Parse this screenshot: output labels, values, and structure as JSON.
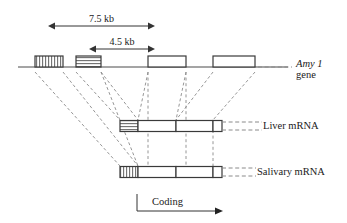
{
  "figure": {
    "gene_label_line1": "Amy 1",
    "gene_label_line2": "gene",
    "liver_label": "Liver mRNA",
    "salivary_label": "Salivary mRNA",
    "coding_label": "Coding"
  },
  "dimensions": [
    {
      "label": "7.5 kb",
      "x_start": 55,
      "x_end": 148,
      "y": 20
    },
    {
      "label": "4.5 kb",
      "x_start": 96,
      "x_end": 148,
      "y": 43
    }
  ],
  "colors": {
    "line": "#4a4a4a",
    "box_stroke": "#3a3a3a",
    "hatch": "#6e6e6e",
    "dashed": "#8a8a8a",
    "text": "#1a1a1a",
    "background": "#ffffff"
  },
  "gene_track": {
    "y": 67,
    "x_start": 18,
    "x_end": 288,
    "exons": [
      {
        "name": "exon-1",
        "x": 35,
        "width": 28,
        "fill": "vertical-hatch"
      },
      {
        "name": "exon-2",
        "x": 76,
        "width": 25,
        "fill": "horizontal-hatch"
      },
      {
        "name": "exon-3",
        "x": 148,
        "width": 38,
        "fill": "none"
      },
      {
        "name": "exon-4",
        "x": 213,
        "width": 42,
        "fill": "none"
      }
    ]
  },
  "liver_mrna": {
    "y": 126,
    "x_start": 120,
    "x_end": 222,
    "segments": [
      {
        "name": "liver-segment-1",
        "x": 120,
        "width": 18,
        "fill": "horizontal-hatch"
      },
      {
        "name": "liver-segment-2",
        "x": 138,
        "width": 38,
        "fill": "none"
      },
      {
        "name": "liver-segment-3",
        "x": 176,
        "width": 37,
        "fill": "none"
      },
      {
        "name": "liver-segment-4",
        "x": 213,
        "width": 9,
        "fill": "none"
      }
    ]
  },
  "salivary_mrna": {
    "y": 172,
    "x_start": 120,
    "x_end": 222,
    "segments": [
      {
        "name": "salivary-segment-1",
        "x": 120,
        "width": 18,
        "fill": "vertical-hatch"
      },
      {
        "name": "salivary-segment-2",
        "x": 138,
        "width": 38,
        "fill": "none"
      },
      {
        "name": "salivary-segment-3",
        "x": 176,
        "width": 37,
        "fill": "none"
      },
      {
        "name": "salivary-segment-4",
        "x": 213,
        "width": 9,
        "fill": "none"
      }
    ]
  },
  "coding_arrow": {
    "tick_x": 137,
    "tick_y_top": 194,
    "baseline_y": 211,
    "arrow_x_end": 215,
    "label_x": 152,
    "label_y": 196
  },
  "splice_connectors": {
    "to_liver": [
      {
        "from_x": 76,
        "to_x": 120
      },
      {
        "from_x": 101,
        "to_x": 138
      },
      {
        "from_x": 148,
        "to_x": 138
      },
      {
        "from_x": 186,
        "to_x": 176
      },
      {
        "from_x": 213,
        "to_x": 176
      },
      {
        "from_x": 255,
        "to_x": 213
      }
    ],
    "to_salivary": [
      {
        "from_x": 35,
        "to_x": 120
      },
      {
        "from_x": 63,
        "to_x": 138
      },
      {
        "from_x": 101,
        "to_x": 138
      }
    ],
    "verticals": [
      {
        "x": 148,
        "y_top": 72,
        "y_bottom": 172
      },
      {
        "x": 186,
        "y_top": 72,
        "y_bottom": 172
      },
      {
        "x": 213,
        "y_top": 130,
        "y_bottom": 172
      }
    ]
  },
  "leaders": {
    "gene": {
      "x_start": 258,
      "x_end": 292,
      "y": 67
    },
    "liver": {
      "x_start": 222,
      "x_end": 262,
      "y_top": 122,
      "y_bottom": 130
    },
    "salivary": {
      "x_start": 222,
      "x_end": 256,
      "y_top": 168,
      "y_bottom": 176
    }
  },
  "label_positions": {
    "gene_x": 296,
    "gene_y": 58,
    "liver_x": 263,
    "liver_y": 120,
    "salivary_x": 257,
    "salivary_y": 166
  }
}
